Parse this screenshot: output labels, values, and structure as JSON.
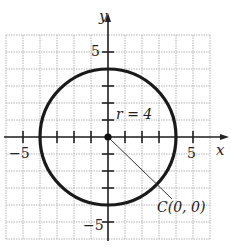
{
  "chart_data": {
    "type": "scatter",
    "title": "",
    "xlabel": "x",
    "ylabel": "y",
    "xlim": [
      -6,
      6
    ],
    "ylim": [
      -6,
      6
    ],
    "grid": true,
    "x_tick_labels": [
      "-5",
      "5"
    ],
    "y_tick_labels": [
      "5",
      "-5"
    ],
    "shapes": [
      {
        "kind": "circle",
        "center": [
          0,
          0
        ],
        "radius": 4
      }
    ],
    "points": [
      {
        "x": 0,
        "y": 0,
        "label": "C(0, 0)"
      }
    ],
    "annotations": [
      "r = 4",
      "C(0, 0)"
    ]
  },
  "labels": {
    "x_axis": "x",
    "y_axis": "y",
    "x_neg5": "−5",
    "x_pos5": "5",
    "y_pos5": "5",
    "y_neg5": "−5",
    "radius": "r = 4",
    "center": "C(0, 0)"
  },
  "colors": {
    "grid": "#b5b5b5",
    "axis": "#222222",
    "circle": "#1a1a1a"
  }
}
